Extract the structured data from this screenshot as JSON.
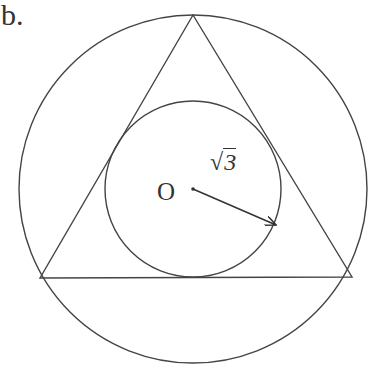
{
  "part_label": "b.",
  "center_label": "O",
  "radius_label": {
    "radical": "√",
    "radicand": "3",
    "text": "√3"
  },
  "figure": {
    "center": [
      193,
      189
    ],
    "outer_circle_radius": 174,
    "inner_circle_radius": 88,
    "triangle_vertices": [
      [
        193,
        15
      ],
      [
        40,
        278
      ],
      [
        352,
        277
      ]
    ],
    "arrow": {
      "from": [
        193,
        189
      ],
      "to": [
        276,
        225
      ]
    },
    "stroke_color": "#444444"
  }
}
